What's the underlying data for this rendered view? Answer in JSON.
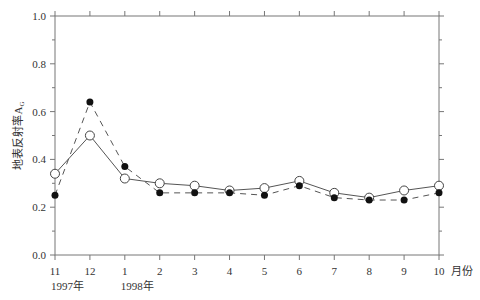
{
  "chart_data": {
    "type": "line",
    "title": "",
    "xlabel": "月份",
    "ylabel": "地表反射率A_G",
    "ylim": [
      0.0,
      1.0
    ],
    "yticks": [
      "0.0",
      "0.2",
      "0.4",
      "0.6",
      "0.8",
      "1.0"
    ],
    "categories": [
      "11",
      "12",
      "1",
      "2",
      "3",
      "4",
      "5",
      "6",
      "7",
      "8",
      "9",
      "10"
    ],
    "year_labels": [
      {
        "at": 0,
        "label": "1997年"
      },
      {
        "at": 2,
        "label": "1998年"
      }
    ],
    "grid": false,
    "legend": null,
    "series": [
      {
        "name": "open-circle-solid",
        "marker": "open-circle",
        "line": "solid",
        "values": [
          0.34,
          0.5,
          0.32,
          0.3,
          0.29,
          0.27,
          0.28,
          0.31,
          0.26,
          0.24,
          0.27,
          0.29
        ]
      },
      {
        "name": "filled-circle-dashed",
        "marker": "filled-circle",
        "line": "dashed",
        "values": [
          0.25,
          0.64,
          0.37,
          0.26,
          0.26,
          0.26,
          0.25,
          0.29,
          0.24,
          0.23,
          0.23,
          0.26
        ]
      }
    ]
  }
}
